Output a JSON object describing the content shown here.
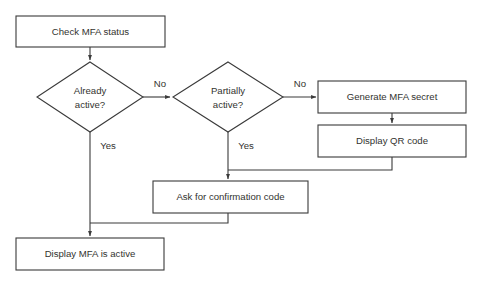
{
  "diagram": {
    "background_color": "#ffffff",
    "stroke_color": "#3a3a3a",
    "text_color": "#33332f",
    "nodes": {
      "check_mfa_status": {
        "label": "Check MFA status",
        "shape": "process"
      },
      "already_active": {
        "label_line1": "Already",
        "label_line2": "active?",
        "shape": "decision"
      },
      "partially_active": {
        "label_line1": "Partially",
        "label_line2": "active?",
        "shape": "decision"
      },
      "generate_mfa_secret": {
        "label": "Generate MFA secret",
        "shape": "process"
      },
      "display_qr_code": {
        "label": "Display QR code",
        "shape": "process"
      },
      "ask_for_confirmation_code": {
        "label": "Ask for confirmation code",
        "shape": "process"
      },
      "display_mfa_is_active": {
        "label": "Display MFA is active",
        "shape": "process"
      }
    },
    "edge_labels": {
      "already_active_no": "No",
      "already_active_yes": "Yes",
      "partially_active_no": "No",
      "partially_active_yes": "Yes"
    }
  }
}
